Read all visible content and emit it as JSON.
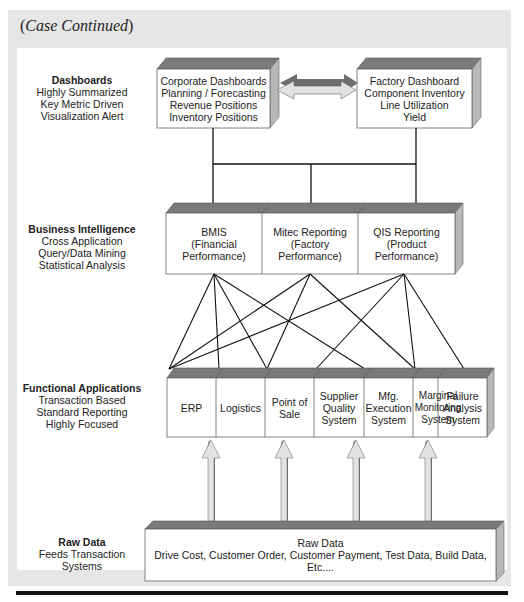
{
  "header": {
    "title_open": "(",
    "title_italic": "Case Continued",
    "title_close": ")"
  },
  "tiers": [
    {
      "id": "dashboards",
      "heading": "Dashboards",
      "lines": [
        "Highly Summarized",
        "Key Metric Driven",
        "Visualization Alert"
      ]
    },
    {
      "id": "business-intelligence",
      "heading": "Business Intelligence",
      "lines": [
        "Cross Application",
        "Query/Data Mining",
        "Statistical Analysis"
      ]
    },
    {
      "id": "functional-applications",
      "heading": "Functional Applications",
      "lines": [
        "Transaction Based",
        "Standard Reporting",
        "Highly Focused"
      ]
    },
    {
      "id": "raw-data",
      "heading": "Raw Data",
      "lines": [
        "Feeds Transaction Systems"
      ]
    }
  ],
  "dashboards": {
    "corporate": [
      "Corporate Dashboards",
      "Planning / Forecasting",
      "Revenue Positions",
      "Inventory Positions"
    ],
    "factory": [
      "Factory Dashboard",
      "Component Inventory",
      "Line Utilization",
      "Yield"
    ]
  },
  "bi_systems": [
    {
      "lines": [
        "BMIS",
        "(Financial",
        "Performance)"
      ]
    },
    {
      "lines": [
        "Mitec Reporting",
        "(Factory",
        "Performance)"
      ]
    },
    {
      "lines": [
        "QIS Reporting",
        "(Product",
        "Performance)"
      ]
    }
  ],
  "functional_apps": [
    {
      "lines": [
        "ERP"
      ]
    },
    {
      "lines": [
        "Logistics"
      ]
    },
    {
      "lines": [
        "Point of",
        "Sale"
      ]
    },
    {
      "lines": [
        "Supplier",
        "Quality",
        "System"
      ]
    },
    {
      "lines": [
        "Mfg.",
        "Execution",
        "System"
      ]
    },
    {
      "lines": [
        "Marginal",
        "Monitoring",
        "System"
      ]
    },
    {
      "lines": [
        "Failure",
        "Analysis",
        "System"
      ]
    }
  ],
  "raw_data_box": {
    "title": "Raw Data",
    "detail": "Drive Cost, Customer Order, Customer Payment, Test Data, Build Data, Etc...."
  },
  "connections": {
    "BMIS": [
      "ERP",
      "Logistics",
      "Point of Sale",
      "Mfg. Execution System"
    ],
    "Mitec Reporting": [
      "ERP",
      "Point of Sale",
      "Marginal Monitoring System"
    ],
    "QIS Reporting": [
      "ERP",
      "Supplier Quality System",
      "Marginal Monitoring System",
      "Failure Analysis System"
    ]
  },
  "raw_data_feeds": [
    "Logistics",
    "Point of Sale",
    "Mfg. Execution System",
    "Marginal Monitoring System"
  ],
  "colors": {
    "panel_bg": "#e6e6e6",
    "box_face": "#ffffff",
    "box_top": "#7a7a7a",
    "box_side": "#b8b8b8",
    "line": "#111111",
    "arrow_light": "#e2e2e2",
    "arrow_dark": "#6e6e6e"
  }
}
